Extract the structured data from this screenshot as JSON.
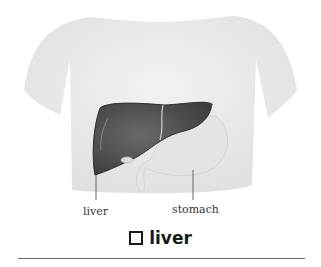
{
  "figure": {
    "labels": {
      "liver": "liver",
      "stomach": "stomach"
    },
    "headword": "liver",
    "headword_icon": "square-bullet-icon",
    "colors": {
      "skin": "#ededed",
      "liver": "#555555",
      "stomach": "#e6e6e6",
      "rule": "#6a6a6a"
    }
  }
}
